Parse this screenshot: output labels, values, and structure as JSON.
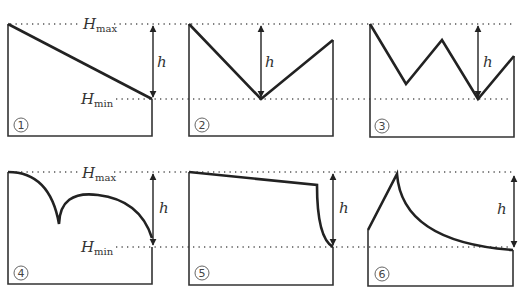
{
  "labels": {
    "h_max": "H",
    "h_max_sub": "max",
    "h_min": "H",
    "h_min_sub": "min",
    "h": "h"
  },
  "panels": [
    {
      "id": "1",
      "number": "1",
      "description": "Linear slope from Hmax at left to Hmin at right"
    },
    {
      "id": "2",
      "number": "2",
      "description": "V-shape with minimum at middle, right end below Hmax"
    },
    {
      "id": "3",
      "number": "3",
      "description": "Zigzag W-shape, lowest point reaches Hmin"
    },
    {
      "id": "4",
      "number": "4",
      "description": "Two convex arcs meeting at a cusp, ending at Hmin"
    },
    {
      "id": "5",
      "number": "5",
      "description": "Gentle slope then steep concave drop to Hmin"
    },
    {
      "id": "6",
      "number": "6",
      "description": "Rise to peak at Hmax then concave decay to Hmin"
    }
  ],
  "colors": {
    "stroke": "#222222",
    "guide": "#555555",
    "background": "#ffffff"
  }
}
